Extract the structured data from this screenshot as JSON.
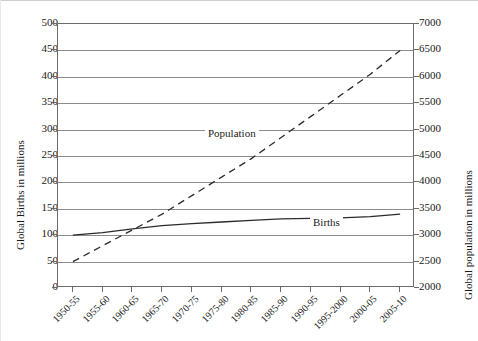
{
  "chart_data": {
    "type": "line",
    "title": "",
    "xlabel": "",
    "categories": [
      "1950-55",
      "1955-60",
      "1960-65",
      "1965-70",
      "1970-75",
      "1975-80",
      "1980-85",
      "1985-90",
      "1990-95",
      "1995-2000",
      "2000-05",
      "2005-10"
    ],
    "grid": true,
    "legend_position": "inline-annotations",
    "axes": {
      "left": {
        "label": "Global Births in millions",
        "ticks": [
          "0",
          "50",
          "100",
          "150",
          "200",
          "250",
          "300",
          "350",
          "400",
          "450",
          "500"
        ],
        "ylim": [
          0,
          500
        ],
        "step": 50
      },
      "right": {
        "label": "Global population in millions",
        "ticks": [
          "2000",
          "2500",
          "3000",
          "3500",
          "4000",
          "4500",
          "5000",
          "5500",
          "6000",
          "6500",
          "7000"
        ],
        "ylim": [
          2000,
          7000
        ],
        "step": 500
      }
    },
    "series": [
      {
        "name": "Population",
        "annotation": "Population",
        "axis": "right",
        "style": "dashed",
        "color": "#2b2b2b",
        "values": [
          2500,
          2800,
          3100,
          3400,
          3750,
          4100,
          4450,
          4850,
          5250,
          5650,
          6050,
          6500
        ]
      },
      {
        "name": "Births",
        "annotation": "Births",
        "axis": "left",
        "style": "solid",
        "color": "#2b2b2b",
        "values": [
          100,
          105,
          112,
          118,
          122,
          125,
          128,
          131,
          132,
          133,
          135,
          140
        ]
      }
    ]
  }
}
